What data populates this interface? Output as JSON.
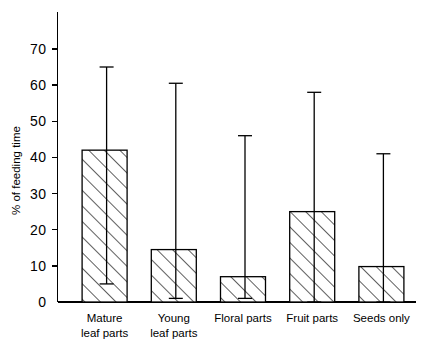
{
  "chart_data": {
    "type": "bar",
    "title": "",
    "xlabel": "",
    "ylabel": "% of feeding time",
    "categories": [
      "Mature leaf parts",
      "Young leaf parts",
      "Floral parts",
      "Fruit parts",
      "Seeds only"
    ],
    "category_lines": [
      [
        "Mature",
        "leaf parts"
      ],
      [
        "Young",
        "leaf parts"
      ],
      [
        "Floral parts"
      ],
      [
        "Fruit parts"
      ],
      [
        "Seeds only"
      ]
    ],
    "values": [
      42,
      14.5,
      7,
      25,
      9.8
    ],
    "error_high": [
      65,
      60.5,
      46,
      58,
      41
    ],
    "error_low": [
      5,
      1,
      1,
      0,
      0
    ],
    "ylim": [
      0,
      78
    ],
    "yticks": [
      0,
      10,
      20,
      30,
      40,
      50,
      60,
      70
    ],
    "ytick_labels": [
      "0",
      "10",
      "20",
      "30",
      "40",
      "50",
      "60",
      "70"
    ],
    "grid": false,
    "legend": null,
    "bar_fill": "diagonal-hatch",
    "bar_color": "#000000",
    "background": "#ffffff",
    "error_bar_style": "asymmetric-range-whisker"
  }
}
